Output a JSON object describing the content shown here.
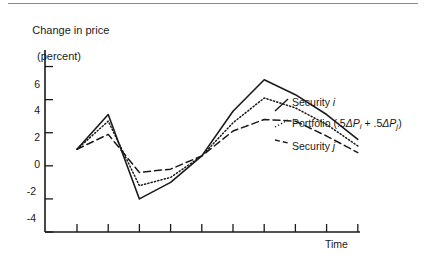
{
  "chart_data": {
    "type": "line",
    "title": "Change in price",
    "subtitle": "(percent)",
    "ylabel": "Change in price (percent)",
    "xlabel": "Time",
    "ylim": [
      -4,
      7
    ],
    "yticks": [
      6,
      4,
      2,
      0,
      -2,
      -4
    ],
    "ytick_labels": [
      "6",
      "4",
      "2",
      "0",
      "-2",
      "-4"
    ],
    "grid": false,
    "legend_position": "right-inline",
    "x": [
      1,
      2,
      3,
      4,
      5,
      6,
      7,
      8,
      9,
      10
    ],
    "xtick_count": 10,
    "xtick_labels": [],
    "series": [
      {
        "name": "Security i",
        "style": "solid",
        "values": [
          1.0,
          3.1,
          -2.0,
          -1.0,
          0.6,
          3.3,
          5.2,
          4.3,
          3.1,
          1.6
        ]
      },
      {
        "name": "Portfolio (.5ΔPi + .5ΔPj)",
        "style": "dotted",
        "values": [
          1.0,
          2.7,
          -1.2,
          -0.7,
          0.6,
          2.6,
          4.1,
          3.5,
          2.5,
          1.2
        ]
      },
      {
        "name": "Security j",
        "style": "dashed",
        "values": [
          1.0,
          1.9,
          -0.4,
          -0.2,
          0.6,
          2.1,
          2.8,
          2.7,
          1.8,
          0.8
        ]
      }
    ]
  },
  "axis": {
    "ytick_labels": [
      "6",
      "4",
      "2",
      "0",
      "-2",
      "-4"
    ],
    "xlabel": "Time"
  },
  "title": {
    "line1": "Change in price",
    "line2": "(percent)"
  },
  "legend": {
    "security_i": {
      "text": "Security ",
      "symbol": "i"
    },
    "portfolio": {
      "prefix": "Portfolio (.5",
      "delta1": "ΔP",
      "sub1": "i",
      "plus": "  +  .5",
      "delta2": "ΔP",
      "sub2": "j",
      "suffix": ")"
    },
    "security_j": {
      "text": "Security ",
      "symbol": "j"
    }
  },
  "colors": {
    "ink": "#1a1a1a",
    "rule": "#8a8a8a",
    "background": "#ffffff"
  }
}
